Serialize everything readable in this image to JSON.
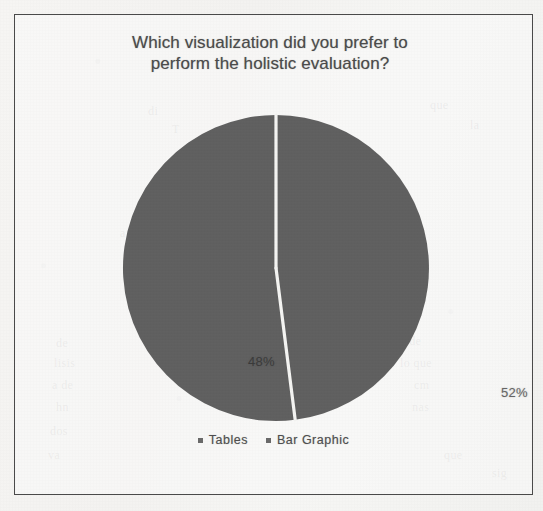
{
  "figure": {
    "title_line1": "Which visualization did you prefer to",
    "title_line2": "perform the holistic evaluation?",
    "frame_color": "#4a4a4a",
    "background_color": "#f3f2f0"
  },
  "chart_data": {
    "type": "pie",
    "title": "Which visualization did you prefer to perform the holistic evaluation?",
    "categories": [
      "Tables",
      "Bar Graphic"
    ],
    "values": [
      48,
      52
    ],
    "value_labels": [
      "48%",
      "52%"
    ],
    "unit": "%",
    "slice_colors": [
      "#606060",
      "#606060"
    ],
    "slice_border_color": "#f4f4f2",
    "legend": {
      "position": "bottom",
      "entries": [
        {
          "label": "Tables",
          "marker": "square",
          "color": "#6a6a6a"
        },
        {
          "label": "Bar Graphic",
          "marker": "square",
          "color": "#6a6a6a"
        }
      ]
    },
    "grid": false,
    "start_angle_deg": 0,
    "note": "Two-slice monochrome pie; both slices rendered in the same gray in this scanned reproduction."
  },
  "ghost_text": {
    "items": [
      {
        "text": "di",
        "x": 148,
        "y": 104
      },
      {
        "text": "T",
        "x": 172,
        "y": 122
      },
      {
        "text": "que",
        "x": 430,
        "y": 98
      },
      {
        "text": "la",
        "x": 470,
        "y": 118
      },
      {
        "text": "a",
        "x": 120,
        "y": 226
      },
      {
        "text": "de",
        "x": 56,
        "y": 336
      },
      {
        "text": "lisis",
        "x": 54,
        "y": 356
      },
      {
        "text": "a de",
        "x": 52,
        "y": 378
      },
      {
        "text": "hn",
        "x": 56,
        "y": 400
      },
      {
        "text": "dos",
        "x": 50,
        "y": 424
      },
      {
        "text": "va",
        "x": 48,
        "y": 448
      },
      {
        "text": "t de",
        "x": 402,
        "y": 334
      },
      {
        "text": "lo que",
        "x": 400,
        "y": 356
      },
      {
        "text": "cm",
        "x": 414,
        "y": 378
      },
      {
        "text": "nas",
        "x": 412,
        "y": 400
      },
      {
        "text": "que",
        "x": 444,
        "y": 448
      },
      {
        "text": "sig",
        "x": 492,
        "y": 466
      }
    ]
  }
}
